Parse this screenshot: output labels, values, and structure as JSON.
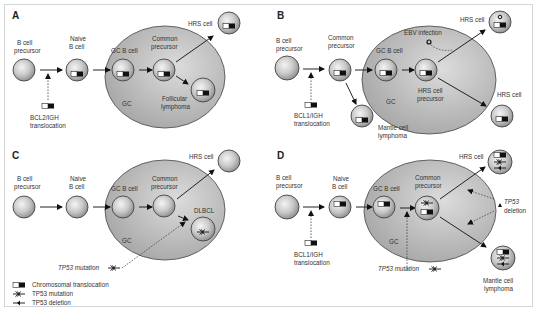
{
  "figure": {
    "colors": {
      "gc_fill": "#b9b9b9",
      "cell_fill": "#c8c8c8",
      "frame": "#d6d6d6",
      "text": "#333333"
    }
  },
  "panels": {
    "A": {
      "letter": "A",
      "labels": {
        "b_cell_precursor_1": "B cell",
        "b_cell_precursor_2": "precursor",
        "naive_1": "Naive",
        "naive_2": "B cell",
        "gc_b_cell": "GC B cell",
        "common_1": "Common",
        "common_2": "precursor",
        "hrs_cell": "HRS cell",
        "gc": "GC",
        "follicular_1": "Follicular",
        "follicular_2": "lymphoma",
        "translocation_1": "BCL2/IGH",
        "translocation_2": "translocation"
      }
    },
    "B": {
      "letter": "B",
      "labels": {
        "b_cell_precursor_1": "B cell",
        "b_cell_precursor_2": "precursor",
        "common_1": "Common",
        "common_2": "precursor",
        "gc_b_cell": "GC B cell",
        "ebv": "EBV infection",
        "hrs_cell_top": "HRS cell",
        "hrs_precursor_1": "HRS cell",
        "hrs_precursor_2": "precursor",
        "hrs_cell_right": "HRS cell",
        "gc": "GC",
        "mantle_1": "Mantle cell",
        "mantle_2": "lymphoma",
        "translocation_1": "BCL1/IGH",
        "translocation_2": "translocation"
      }
    },
    "C": {
      "letter": "C",
      "labels": {
        "b_cell_precursor_1": "B cell",
        "b_cell_precursor_2": "precursor",
        "naive_1": "Naive",
        "naive_2": "B cell",
        "gc_b_cell": "GC B cell",
        "common_1": "Common",
        "common_2": "precursor",
        "hrs_cell": "HRS cell",
        "dlbcl": "DLBCL",
        "gc": "GC",
        "tp53_mutation": "TP53 mutation"
      }
    },
    "D": {
      "letter": "D",
      "labels": {
        "b_cell_precursor_1": "B cell",
        "b_cell_precursor_2": "precursor",
        "naive_1": "Naive",
        "naive_2": "B cell",
        "gc_b_cell": "GC B cell",
        "common_1": "Common",
        "common_2": "precursor",
        "hrs_cell": "HRS cell",
        "tp53_deletion_1": "TP53",
        "tp53_deletion_2": "deletion",
        "gc": "GC",
        "tp53_mutation": "TP53 mutation",
        "mantle_1": "Mantle cell",
        "mantle_2": "lymphoma",
        "translocation_1": "BCL1/IGH",
        "translocation_2": "translocation"
      }
    }
  },
  "legend": {
    "items": [
      {
        "icon": "chromosomal-translocation-icon",
        "label": "Chromosomal translocation"
      },
      {
        "icon": "tp53-mutation-icon",
        "label": "TP53 mutation"
      },
      {
        "icon": "tp53-deletion-icon",
        "label": "TP53 deletion"
      }
    ]
  }
}
